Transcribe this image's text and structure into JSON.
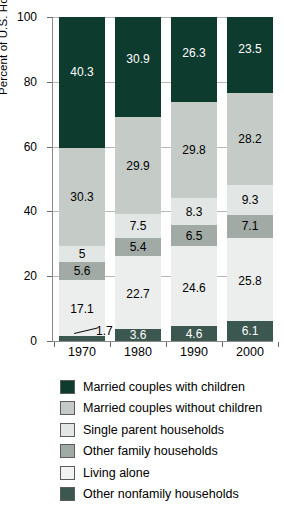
{
  "chart_data": {
    "type": "bar",
    "subtype": "stacked-bar-100",
    "title": "",
    "xlabel": "",
    "ylabel": "Percent of U.S. Households",
    "ylim": [
      0,
      100
    ],
    "yticks": [
      0,
      20,
      40,
      60,
      80,
      100
    ],
    "ytick_labels": [
      "0",
      "20",
      "40",
      "60",
      "80",
      "100"
    ],
    "grid": true,
    "grid_axis": "y",
    "legend_position": "bottom",
    "categories": [
      "1970",
      "1980",
      "1990",
      "2000"
    ],
    "stack_order": "bottom-to-top",
    "series": [
      {
        "name": "Other nonfamily households",
        "color": "#3c5750",
        "label_color": "#ffffff",
        "values": [
          1.7,
          3.6,
          4.6,
          6.1
        ],
        "value_labels": [
          "1.7",
          "3.6",
          "4.6",
          "6.1"
        ],
        "first_label_is_callout": true
      },
      {
        "name": "Living alone",
        "color": "#eceeed",
        "label_color": "#000000",
        "values": [
          17.1,
          22.7,
          24.6,
          25.8
        ],
        "value_labels": [
          "17.1",
          "22.7",
          "24.6",
          "25.8"
        ]
      },
      {
        "name": "Other family households",
        "color": "#a2aaa6",
        "label_color": "#000000",
        "values": [
          5.6,
          5.4,
          6.5,
          7.1
        ],
        "value_labels": [
          "5.6",
          "5.4",
          "6.5",
          "7.1"
        ]
      },
      {
        "name": "Single parent households",
        "color": "#e2e6e4",
        "label_color": "#000000",
        "values": [
          5.0,
          7.5,
          8.3,
          9.3
        ],
        "value_labels": [
          "5",
          "7.5",
          "8.3",
          "9.3"
        ]
      },
      {
        "name": "Married couples without children",
        "color": "#c5ccc8",
        "label_color": "#000000",
        "values": [
          30.3,
          29.9,
          29.8,
          28.2
        ],
        "value_labels": [
          "30.3",
          "29.9",
          "29.8",
          "28.2"
        ]
      },
      {
        "name": "Married couples with children",
        "color": "#0d3b2e",
        "label_color": "#ffffff",
        "values": [
          40.3,
          30.9,
          26.3,
          23.5
        ],
        "value_labels": [
          "40.3",
          "30.9",
          "26.3",
          "23.5"
        ]
      }
    ]
  },
  "legend": {
    "items": [
      {
        "label": "Married couples with children",
        "color": "#0d3b2e"
      },
      {
        "label": "Married couples without children",
        "color": "#c5ccc8"
      },
      {
        "label": "Single parent households",
        "color": "#e2e6e4"
      },
      {
        "label": "Other family households",
        "color": "#a2aaa6"
      },
      {
        "label": "Living alone",
        "color": "#f2f4f3"
      },
      {
        "label": "Other nonfamily households",
        "color": "#3c5750"
      }
    ]
  },
  "callouts": {
    "tiny_segment_value": "1.7"
  }
}
